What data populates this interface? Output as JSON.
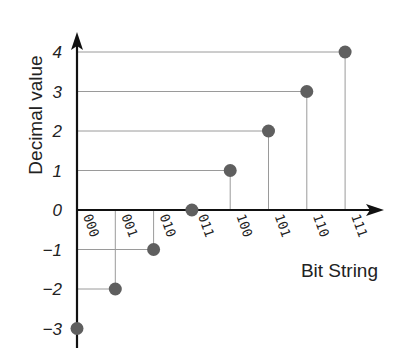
{
  "chart_data": {
    "type": "scatter",
    "style": "stem",
    "title": "",
    "xlabel": "Bit String",
    "ylabel": "Decimal value",
    "categories": [
      "000",
      "001",
      "010",
      "011",
      "100",
      "101",
      "110",
      "111"
    ],
    "values": [
      -3,
      -2,
      -1,
      0,
      1,
      2,
      3,
      4
    ],
    "y_ticks": [
      4,
      3,
      2,
      1,
      0,
      -1,
      -2,
      -3
    ],
    "y_tick_labels": [
      "4",
      "3",
      "2",
      "1",
      "0",
      "−1",
      "−2",
      "−3"
    ],
    "ylim": [
      -3,
      4
    ],
    "grid": false,
    "legend": null,
    "colors": {
      "point": "#5f5f5f",
      "axis": "#111111",
      "guide": "#9a9a9a"
    }
  }
}
